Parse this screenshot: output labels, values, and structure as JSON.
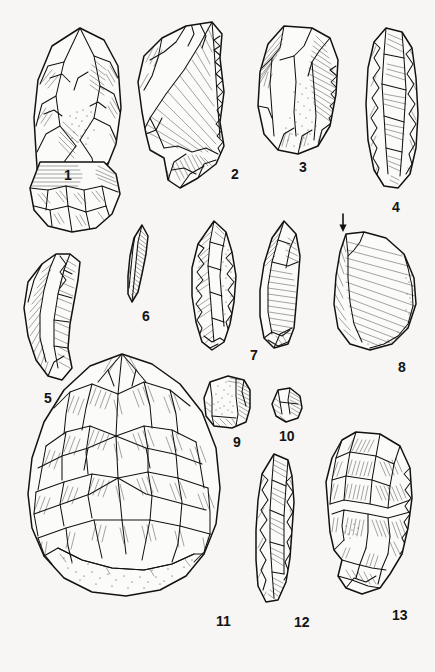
{
  "plate": {
    "title": "Lithic artefact plate",
    "description": "Scientific line-drawing plate of thirteen knapped stone (flint) artefacts arranged in four rows; pen-and-ink hatched illustration on off-white ground.",
    "background_color": "#f7f6f4",
    "ink_color": "#14120f",
    "width": 435,
    "height": 672,
    "figure_count": 13,
    "markers": [
      {
        "name": "impact-point-arrow",
        "glyph": "down-arrow",
        "refers_to": "8",
        "x": 342,
        "y": 222
      }
    ],
    "figures": [
      {
        "number": "1",
        "label": "1",
        "label_x": 64,
        "label_y": 168,
        "type": "bifacial point / handaxe",
        "row": 1
      },
      {
        "number": "2",
        "label": "2",
        "label_x": 231,
        "label_y": 167,
        "type": "retouched flake",
        "row": 1
      },
      {
        "number": "3",
        "label": "3",
        "label_x": 299,
        "label_y": 160,
        "type": "cortical flake with stippled cortex",
        "row": 1
      },
      {
        "number": "4",
        "label": "4",
        "label_x": 392,
        "label_y": 200,
        "type": "elongated blade / side-scraper",
        "row": 1
      },
      {
        "number": "5",
        "label": "5",
        "label_x": 44,
        "label_y": 391,
        "type": "curved backed blade",
        "row": 2
      },
      {
        "number": "6",
        "label": "6",
        "label_x": 142,
        "label_y": 309,
        "type": "narrow bladelet",
        "row": 2
      },
      {
        "number": "7",
        "label": "7",
        "label_x": 250,
        "label_y": 348,
        "type": "pointed flake, dorsal and ventral views",
        "row": 2
      },
      {
        "number": "8",
        "label": "8",
        "label_x": 398,
        "label_y": 360,
        "type": "large cortex-backed flake",
        "row": 2
      },
      {
        "number": "9",
        "label": "9",
        "label_x": 233,
        "label_y": 435,
        "type": "small cortical chunk",
        "row": 3
      },
      {
        "number": "10",
        "label": "10",
        "label_x": 279,
        "label_y": 429,
        "type": "small angular fragment",
        "row": 3
      },
      {
        "number": "11",
        "label": "11",
        "label_x": 216,
        "label_y": 614,
        "type": "large cordiform handaxe with cortical butt",
        "row": 4
      },
      {
        "number": "12",
        "label": "12",
        "label_x": 294,
        "label_y": 615,
        "type": "narrow elongated point",
        "row": 4
      },
      {
        "number": "13",
        "label": "13",
        "label_x": 392,
        "label_y": 608,
        "type": "thick asymmetric core / chopper",
        "row": 4
      }
    ]
  }
}
